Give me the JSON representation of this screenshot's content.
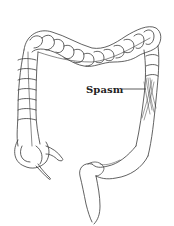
{
  "figure": {
    "annotation": {
      "text": "Spasm",
      "target": "descending colon"
    },
    "colors": {
      "background": "#ffffff",
      "line": "#333333",
      "text": "#222222"
    }
  }
}
